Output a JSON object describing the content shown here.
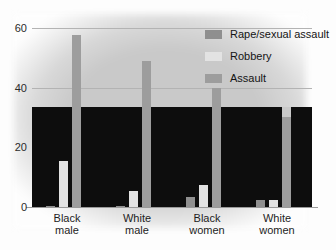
{
  "figure": {
    "cropped_top_text": "",
    "background_note": "scanned bar chart"
  },
  "chart_data": {
    "type": "bar",
    "title": "",
    "subtitle": "",
    "xlabel": "",
    "ylabel": "",
    "categories": [
      "Black male",
      "White male",
      "Black women",
      "White women"
    ],
    "category_lines": [
      [
        "Black",
        "male"
      ],
      [
        "White",
        "male"
      ],
      [
        "Black",
        "women"
      ],
      [
        "White",
        "women"
      ]
    ],
    "series": [
      {
        "name": "Rape/sexual assault",
        "color": "#8f8f8f",
        "values": [
          0.3,
          0.4,
          3.5,
          2.2
        ]
      },
      {
        "name": "Robbery",
        "color": "#e3e3e3",
        "values": [
          15.5,
          5.5,
          7.5,
          2.2
        ]
      },
      {
        "name": "Assault",
        "color": "#9d9d9d",
        "values": [
          57.5,
          49.0,
          40.0,
          30.0
        ]
      }
    ],
    "ylim": [
      0,
      62
    ],
    "yticks": [
      0,
      20,
      40,
      60
    ],
    "ytick_labels": [
      "0",
      "20",
      "40",
      "60"
    ],
    "grid": true,
    "legend_position": "upper right",
    "annotations": []
  },
  "legend": {
    "entries": [
      {
        "label": "Rape/sexual assault",
        "swatch": "#8f8f8f"
      },
      {
        "label": "Robbery",
        "swatch": "#e3e3e3"
      },
      {
        "label": "Assault",
        "swatch": "#9d9d9d"
      }
    ]
  },
  "colors": {
    "rape_sexual_assault": "#8f8f8f",
    "robbery": "#e3e3e3",
    "assault": "#9d9d9d",
    "gridline": "#b3b3b3",
    "axis_text": "#1d1d1d",
    "scan_band": "#0d0d0d",
    "page": "#fdfdfd"
  }
}
